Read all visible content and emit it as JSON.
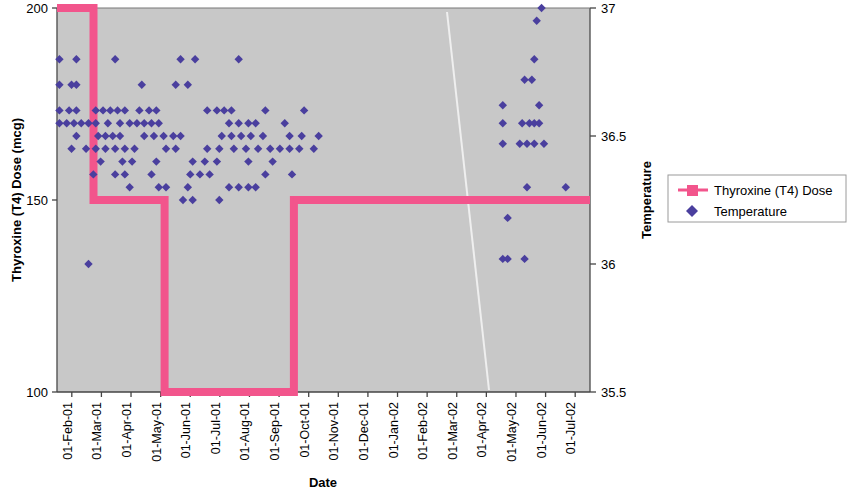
{
  "chart_data": {
    "type": "scatter",
    "title": "",
    "xlabel": "Date",
    "ylabel": "Thyroxine (T4) Dose (mcg)",
    "y2label": "Temperature",
    "grid": false,
    "plot_background": "#c8c8c8",
    "legend_position": "right",
    "xlim": [
      "01-Feb-01",
      "01-Aug-02"
    ],
    "x_tick_labels": [
      "01-Feb-01",
      "01-Mar-01",
      "01-Apr-01",
      "01-May-01",
      "01-Jun-01",
      "01-Jul-01",
      "01-Aug-01",
      "01-Sep-01",
      "01-Oct-01",
      "01-Nov-01",
      "01-Dec-01",
      "01-Jan-02",
      "01-Feb-02",
      "01-Mar-02",
      "01-Apr-02",
      "01-May-02",
      "01-Jun-02",
      "01-Jul-02"
    ],
    "ylim": [
      100,
      200
    ],
    "y_tick_labels": [
      "100",
      "150",
      "200"
    ],
    "y_ticks": [
      100,
      150,
      200
    ],
    "y2lim": [
      35.5,
      37
    ],
    "y2_tick_labels": [
      "35.5",
      "36",
      "36.5",
      "37"
    ],
    "y2_ticks": [
      35.5,
      36,
      36.5,
      37
    ],
    "series": [
      {
        "name": "Thyroxine (T4) Dose",
        "type": "step",
        "color": "#f2558c",
        "axis": "left",
        "units": "mcg",
        "steps": [
          {
            "from": "01-Feb-01",
            "to": "08-Mar-01",
            "dose": 200
          },
          {
            "from": "08-Mar-01",
            "to": "20-May-01",
            "dose": 150
          },
          {
            "from": "20-May-01",
            "to": "01-Oct-01",
            "dose": 100
          },
          {
            "from": "01-Oct-01",
            "to": "01-Aug-02",
            "dose": 150
          }
        ]
      },
      {
        "name": "Temperature",
        "type": "scatter",
        "color": "#4a3f9e",
        "axis": "right",
        "units": "degC",
        "points": [
          [
            0.5,
            36.8
          ],
          [
            4.0,
            36.8
          ],
          [
            12.0,
            36.8
          ],
          [
            25.5,
            36.8
          ],
          [
            28.5,
            36.8
          ],
          [
            37.5,
            36.8
          ],
          [
            0.5,
            36.7
          ],
          [
            3.0,
            36.7
          ],
          [
            4.0,
            36.7
          ],
          [
            17.5,
            36.7
          ],
          [
            24.5,
            36.7
          ],
          [
            27.0,
            36.7
          ],
          [
            0.5,
            36.6
          ],
          [
            2.5,
            36.6
          ],
          [
            4.0,
            36.6
          ],
          [
            8.0,
            36.6
          ],
          [
            9.5,
            36.6
          ],
          [
            11.0,
            36.6
          ],
          [
            12.5,
            36.6
          ],
          [
            14.0,
            36.6
          ],
          [
            17.0,
            36.6
          ],
          [
            19.0,
            36.6
          ],
          [
            20.5,
            36.6
          ],
          [
            31.0,
            36.6
          ],
          [
            33.0,
            36.6
          ],
          [
            34.5,
            36.6
          ],
          [
            36.0,
            36.6
          ],
          [
            43.0,
            36.6
          ],
          [
            51.0,
            36.6
          ],
          [
            0.5,
            36.55
          ],
          [
            2.0,
            36.55
          ],
          [
            3.5,
            36.55
          ],
          [
            5.0,
            36.55
          ],
          [
            6.5,
            36.55
          ],
          [
            8.0,
            36.55
          ],
          [
            10.5,
            36.55
          ],
          [
            13.0,
            36.55
          ],
          [
            15.0,
            36.55
          ],
          [
            16.5,
            36.55
          ],
          [
            18.0,
            36.55
          ],
          [
            19.5,
            36.55
          ],
          [
            21.0,
            36.55
          ],
          [
            35.5,
            36.55
          ],
          [
            37.5,
            36.55
          ],
          [
            39.5,
            36.55
          ],
          [
            41.0,
            36.55
          ],
          [
            47.0,
            36.55
          ],
          [
            4.0,
            36.5
          ],
          [
            6.5,
            36.0
          ],
          [
            8.5,
            36.5
          ],
          [
            10.0,
            36.5
          ],
          [
            11.5,
            36.5
          ],
          [
            13.0,
            36.5
          ],
          [
            18.0,
            36.5
          ],
          [
            20.0,
            36.5
          ],
          [
            22.0,
            36.5
          ],
          [
            24.0,
            36.5
          ],
          [
            25.5,
            36.5
          ],
          [
            34.0,
            36.5
          ],
          [
            36.0,
            36.5
          ],
          [
            38.0,
            36.5
          ],
          [
            40.0,
            36.5
          ],
          [
            42.5,
            36.5
          ],
          [
            48.0,
            36.5
          ],
          [
            50.5,
            36.5
          ],
          [
            54.0,
            36.5
          ],
          [
            3.0,
            36.45
          ],
          [
            6.0,
            36.45
          ],
          [
            8.0,
            36.45
          ],
          [
            10.0,
            36.45
          ],
          [
            12.0,
            36.45
          ],
          [
            14.0,
            36.45
          ],
          [
            16.0,
            36.45
          ],
          [
            22.5,
            36.45
          ],
          [
            24.5,
            36.45
          ],
          [
            31.0,
            36.45
          ],
          [
            33.5,
            36.45
          ],
          [
            36.5,
            36.45
          ],
          [
            39.0,
            36.45
          ],
          [
            41.5,
            36.45
          ],
          [
            44.0,
            36.45
          ],
          [
            46.0,
            36.45
          ],
          [
            48.0,
            36.45
          ],
          [
            50.0,
            36.45
          ],
          [
            53.0,
            36.45
          ],
          [
            9.0,
            36.4
          ],
          [
            13.5,
            36.4
          ],
          [
            15.5,
            36.4
          ],
          [
            20.5,
            36.4
          ],
          [
            28.0,
            36.4
          ],
          [
            30.5,
            36.4
          ],
          [
            33.0,
            36.4
          ],
          [
            39.5,
            36.4
          ],
          [
            44.5,
            36.4
          ],
          [
            7.5,
            36.35
          ],
          [
            12.0,
            36.35
          ],
          [
            14.0,
            36.35
          ],
          [
            19.5,
            36.35
          ],
          [
            27.5,
            36.35
          ],
          [
            29.5,
            36.35
          ],
          [
            31.5,
            36.35
          ],
          [
            43.0,
            36.35
          ],
          [
            48.5,
            36.35
          ],
          [
            15.0,
            36.3
          ],
          [
            21.0,
            36.3
          ],
          [
            22.5,
            36.3
          ],
          [
            27.0,
            36.3
          ],
          [
            35.5,
            36.3
          ],
          [
            37.5,
            36.3
          ],
          [
            39.5,
            36.3
          ],
          [
            41.0,
            36.3
          ],
          [
            26.0,
            36.25
          ],
          [
            28.0,
            36.25
          ],
          [
            33.5,
            36.25
          ],
          [
            100.0,
            37.0
          ],
          [
            99.0,
            36.95
          ],
          [
            98.5,
            36.8
          ],
          [
            96.5,
            36.72
          ],
          [
            98.0,
            36.72
          ],
          [
            92.0,
            36.62
          ],
          [
            99.5,
            36.62
          ],
          [
            92.0,
            36.55
          ],
          [
            96.0,
            36.55
          ],
          [
            97.5,
            36.55
          ],
          [
            98.5,
            36.55
          ],
          [
            99.5,
            36.55
          ],
          [
            92.0,
            36.47
          ],
          [
            95.5,
            36.47
          ],
          [
            97.0,
            36.47
          ],
          [
            98.5,
            36.47
          ],
          [
            100.5,
            36.47
          ],
          [
            97.0,
            36.3
          ],
          [
            105.0,
            36.3
          ],
          [
            93.0,
            36.18
          ],
          [
            92.0,
            36.02
          ],
          [
            93.0,
            36.02
          ],
          [
            96.5,
            36.02
          ]
        ]
      }
    ],
    "annotations": []
  },
  "legend": {
    "entries": [
      {
        "label": "Thyroxine (T4) Dose",
        "marker": "line-square",
        "color": "#f2558c"
      },
      {
        "label": "Temperature",
        "marker": "diamond",
        "color": "#4a3f9e"
      }
    ]
  },
  "axes": {
    "left_title": "Thyroxine (T4) Dose (mcg)",
    "right_title": "Temperature",
    "bottom_title": "Date"
  }
}
